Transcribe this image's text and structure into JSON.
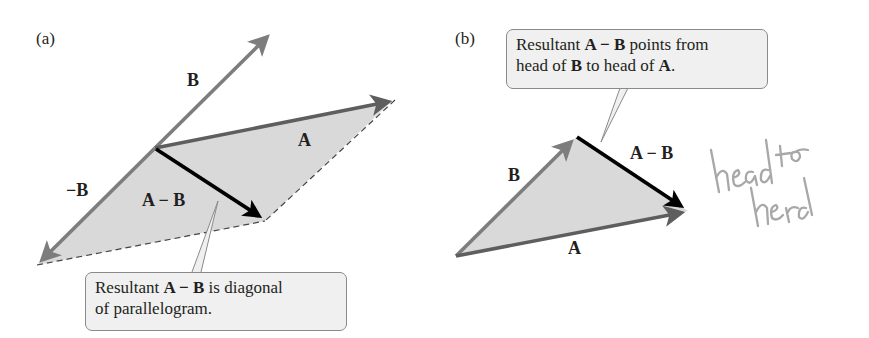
{
  "panel_a": {
    "label": "(a)",
    "vectors": {
      "A": "A",
      "B": "B",
      "neg_B": "−B",
      "A_minus_B": "A − B"
    },
    "callout": {
      "t1": "Resultant ",
      "t2": "A − B",
      "t3": " is diagonal",
      "t4": "of parallelogram."
    }
  },
  "panel_b": {
    "label": "(b)",
    "vectors": {
      "A": "A",
      "B": "B",
      "A_minus_B": "A − B"
    },
    "callout": {
      "t1": "Resultant ",
      "t2": "A − B",
      "t3": " points from",
      "t4": "head of ",
      "t5": "B",
      "t6": " to head of ",
      "t7": "A",
      "t8": "."
    },
    "handwritten_note": "head to head"
  },
  "colors": {
    "vector_gray": "#7d7d7d",
    "vector_dark": "#5e5e5e",
    "resultant_black": "#000000",
    "fill_gray": "#d9d9d9",
    "callout_bg": "#f0f0f0",
    "handwriting": "#a8a8a8"
  }
}
